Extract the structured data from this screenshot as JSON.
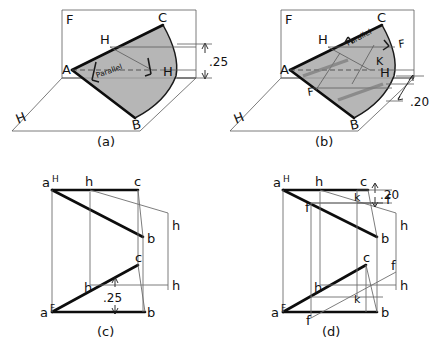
{
  "figure": {
    "background_color": "#ffffff",
    "ink_color": "#111111",
    "shade_color": "#a9a9a9"
  },
  "panels": [
    {
      "id": "a",
      "caption": "(a)",
      "type": "pictorial",
      "plane_labels": {
        "frontal": "F",
        "horizontal": "H"
      },
      "vertices": [
        {
          "name": "A",
          "label": "A"
        },
        {
          "name": "B",
          "label": "B"
        },
        {
          "name": "C",
          "label": "C"
        }
      ],
      "line_labels": [
        {
          "label": "H",
          "role": "horizontal-line-upper"
        },
        {
          "label": "H",
          "role": "horizontal-line-lower"
        }
      ],
      "annotation": "Parallel",
      "dimension": {
        "value": ".25",
        "orientation": "vertical"
      }
    },
    {
      "id": "b",
      "caption": "(b)",
      "type": "pictorial",
      "plane_labels": {
        "frontal": "F",
        "horizontal": "H"
      },
      "vertices": [
        {
          "name": "A",
          "label": "A"
        },
        {
          "name": "B",
          "label": "B"
        },
        {
          "name": "C",
          "label": "C"
        }
      ],
      "line_labels": [
        {
          "label": "H",
          "role": "horizontal-line-upper"
        },
        {
          "label": "H",
          "role": "horizontal-line-lower"
        },
        {
          "label": "F",
          "role": "frontal-line-left"
        },
        {
          "label": "F",
          "role": "frontal-line-right"
        },
        {
          "label": "K",
          "role": "intersection-point"
        }
      ],
      "annotation": "Parallel",
      "dimension": {
        "value": ".20",
        "orientation": "oblique"
      }
    },
    {
      "id": "c",
      "caption": "(c)",
      "type": "orthographic",
      "top_view": {
        "view_label": "H",
        "points": [
          {
            "label": "a",
            "superscript": "H"
          },
          {
            "label": "h"
          },
          {
            "label": "c"
          },
          {
            "label": "b"
          }
        ]
      },
      "front_view": {
        "view_label": "F",
        "points": [
          {
            "label": "a",
            "superscript": "F"
          },
          {
            "label": "h"
          },
          {
            "label": "c"
          },
          {
            "label": "b"
          }
        ]
      },
      "side_labels": [
        {
          "label": "h",
          "role": "upper-right-extension"
        },
        {
          "label": "h",
          "role": "lower-right-extension"
        }
      ],
      "dimension": {
        "value": ".25",
        "orientation": "vertical"
      }
    },
    {
      "id": "d",
      "caption": "(d)",
      "type": "orthographic",
      "top_view": {
        "view_label": "H",
        "points": [
          {
            "label": "a",
            "superscript": "H"
          },
          {
            "label": "h"
          },
          {
            "label": "c"
          },
          {
            "label": "k"
          },
          {
            "label": "f",
            "role": "left"
          },
          {
            "label": "f",
            "role": "right"
          },
          {
            "label": "b"
          }
        ]
      },
      "front_view": {
        "view_label": "F",
        "points": [
          {
            "label": "a",
            "superscript": "F"
          },
          {
            "label": "h"
          },
          {
            "label": "c"
          },
          {
            "label": "k"
          },
          {
            "label": "f",
            "role": "bottom"
          },
          {
            "label": "f",
            "role": "right"
          },
          {
            "label": "b"
          }
        ]
      },
      "side_labels": [
        {
          "label": "h",
          "role": "upper-right-extension"
        },
        {
          "label": "h",
          "role": "lower-right-extension"
        }
      ],
      "dimension": {
        "value": ".20",
        "orientation": "vertical"
      }
    }
  ]
}
